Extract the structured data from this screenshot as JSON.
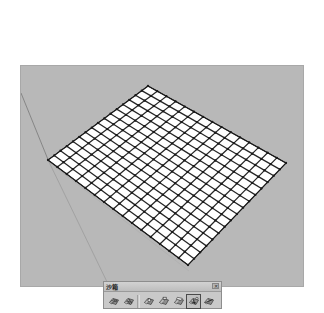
{
  "window": {
    "title": "",
    "background_color": "#ffffff"
  },
  "viewport": {
    "name": "3d-modeling-viewport",
    "background_color": "#b9b9b9",
    "ground_color": "#b5b5b5",
    "guide_line_color": "#6e6e6e",
    "mesh": {
      "name": "sandbox-terrain-grid",
      "fill_color": "#ffffff",
      "edge_color": "#1a1a1a",
      "columns": 16,
      "rows": 15,
      "corners": {
        "top": [
          148,
          86
        ],
        "right": [
          286,
          163
        ],
        "bottom": [
          188,
          265
        ],
        "left": [
          48,
          160
        ]
      }
    }
  },
  "palette": {
    "name": "sandbox-toolbar",
    "title": "沙箱",
    "close_label": "✕",
    "tools": [
      {
        "name": "from-contours-tool",
        "label": "从等高线创建",
        "selected": false,
        "icon": "terrain-contours-icon"
      },
      {
        "name": "from-scratch-tool",
        "label": "从头创建",
        "selected": false,
        "icon": "terrain-grid-icon"
      },
      {
        "name": "smoove-tool",
        "label": "曲面起伏",
        "selected": false,
        "icon": "terrain-smoove-icon"
      },
      {
        "name": "stamp-tool",
        "label": "曲面印章",
        "selected": false,
        "icon": "terrain-stamp-icon"
      },
      {
        "name": "drape-tool",
        "label": "曲面投影",
        "selected": false,
        "icon": "terrain-drape-icon"
      },
      {
        "name": "add-detail-tool",
        "label": "添加细部",
        "selected": true,
        "icon": "terrain-detail-icon"
      },
      {
        "name": "flip-edge-tool",
        "label": "对调角线",
        "selected": false,
        "icon": "terrain-flip-edge-icon"
      }
    ],
    "separator_after_index": 1
  }
}
